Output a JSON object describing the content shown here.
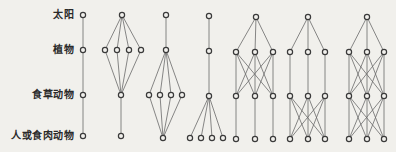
{
  "levels": [
    {
      "label": "太阳",
      "y": 15
    },
    {
      "label": "植物",
      "y": 50
    },
    {
      "label": "食草动物",
      "y": 95
    },
    {
      "label": "人或食肉动物",
      "y": 136
    }
  ],
  "colors": {
    "background": "#f1f0ec",
    "edge": "#6a6a6a",
    "node": "#3a3a3a"
  },
  "networks": [
    {
      "id": "chain-simple",
      "nodes": [
        [
          83,
          15
        ],
        [
          83,
          50
        ],
        [
          83,
          95
        ],
        [
          83,
          136
        ]
      ],
      "edges": [
        [
          0,
          1
        ],
        [
          1,
          2
        ],
        [
          2,
          3
        ]
      ]
    },
    {
      "id": "four-plants-one-herbivore",
      "nodes": [
        [
          122,
          15
        ],
        [
          105,
          50
        ],
        [
          117,
          50
        ],
        [
          129,
          50
        ],
        [
          141,
          50
        ],
        [
          121,
          95
        ],
        [
          121,
          136
        ]
      ],
      "edges": [
        [
          0,
          1
        ],
        [
          0,
          2
        ],
        [
          0,
          3
        ],
        [
          0,
          4
        ],
        [
          1,
          5
        ],
        [
          2,
          5
        ],
        [
          3,
          5
        ],
        [
          4,
          5
        ],
        [
          5,
          6
        ]
      ]
    },
    {
      "id": "one-plant-four-herbivores",
      "nodes": [
        [
          166,
          15
        ],
        [
          166,
          50
        ],
        [
          149,
          95
        ],
        [
          160,
          95
        ],
        [
          171,
          95
        ],
        [
          182,
          95
        ],
        [
          163,
          138
        ]
      ],
      "edges": [
        [
          0,
          1
        ],
        [
          1,
          2
        ],
        [
          1,
          3
        ],
        [
          1,
          4
        ],
        [
          1,
          5
        ],
        [
          2,
          6
        ],
        [
          3,
          6
        ],
        [
          4,
          6
        ],
        [
          5,
          6
        ]
      ]
    },
    {
      "id": "one-herbivore-four-carnivores",
      "nodes": [
        [
          209,
          16
        ],
        [
          209,
          51
        ],
        [
          209,
          96
        ],
        [
          190,
          138
        ],
        [
          201,
          138
        ],
        [
          212,
          138
        ],
        [
          223,
          138
        ]
      ],
      "edges": [
        [
          0,
          1
        ],
        [
          1,
          2
        ],
        [
          2,
          3
        ],
        [
          2,
          4
        ],
        [
          2,
          5
        ],
        [
          2,
          6
        ]
      ]
    },
    {
      "id": "web-plant-herbivore-crossed",
      "nodes": [
        [
          256,
          17
        ],
        [
          236,
          52
        ],
        [
          255,
          52
        ],
        [
          273,
          52
        ],
        [
          236,
          96
        ],
        [
          255,
          96
        ],
        [
          273,
          96
        ],
        [
          236,
          139
        ],
        [
          255,
          139
        ],
        [
          273,
          139
        ]
      ],
      "edges": [
        [
          0,
          1
        ],
        [
          0,
          2
        ],
        [
          0,
          3
        ],
        [
          1,
          4
        ],
        [
          1,
          5
        ],
        [
          1,
          6
        ],
        [
          2,
          4
        ],
        [
          2,
          5
        ],
        [
          2,
          6
        ],
        [
          3,
          4
        ],
        [
          3,
          5
        ],
        [
          3,
          6
        ],
        [
          4,
          7
        ],
        [
          5,
          8
        ],
        [
          6,
          9
        ]
      ]
    },
    {
      "id": "web-herbivore-carnivore-crossed",
      "nodes": [
        [
          308,
          17
        ],
        [
          290,
          52
        ],
        [
          308,
          52
        ],
        [
          325,
          52
        ],
        [
          290,
          96
        ],
        [
          308,
          96
        ],
        [
          325,
          96
        ],
        [
          290,
          139
        ],
        [
          308,
          139
        ],
        [
          325,
          139
        ]
      ],
      "edges": [
        [
          0,
          1
        ],
        [
          0,
          2
        ],
        [
          0,
          3
        ],
        [
          1,
          4
        ],
        [
          2,
          5
        ],
        [
          3,
          6
        ],
        [
          4,
          7
        ],
        [
          4,
          8
        ],
        [
          4,
          9
        ],
        [
          5,
          7
        ],
        [
          5,
          8
        ],
        [
          5,
          9
        ],
        [
          6,
          7
        ],
        [
          6,
          8
        ],
        [
          6,
          9
        ]
      ]
    },
    {
      "id": "web-fully-crossed",
      "nodes": [
        [
          367,
          17
        ],
        [
          349,
          52
        ],
        [
          367,
          52
        ],
        [
          384,
          52
        ],
        [
          349,
          96
        ],
        [
          367,
          96
        ],
        [
          384,
          96
        ],
        [
          349,
          139
        ],
        [
          367,
          139
        ],
        [
          384,
          139
        ]
      ],
      "edges": [
        [
          0,
          1
        ],
        [
          0,
          2
        ],
        [
          0,
          3
        ],
        [
          1,
          4
        ],
        [
          1,
          5
        ],
        [
          1,
          6
        ],
        [
          2,
          4
        ],
        [
          2,
          5
        ],
        [
          2,
          6
        ],
        [
          3,
          4
        ],
        [
          3,
          5
        ],
        [
          3,
          6
        ],
        [
          4,
          7
        ],
        [
          4,
          8
        ],
        [
          4,
          9
        ],
        [
          5,
          7
        ],
        [
          5,
          8
        ],
        [
          5,
          9
        ],
        [
          6,
          7
        ],
        [
          6,
          8
        ],
        [
          6,
          9
        ]
      ]
    }
  ]
}
